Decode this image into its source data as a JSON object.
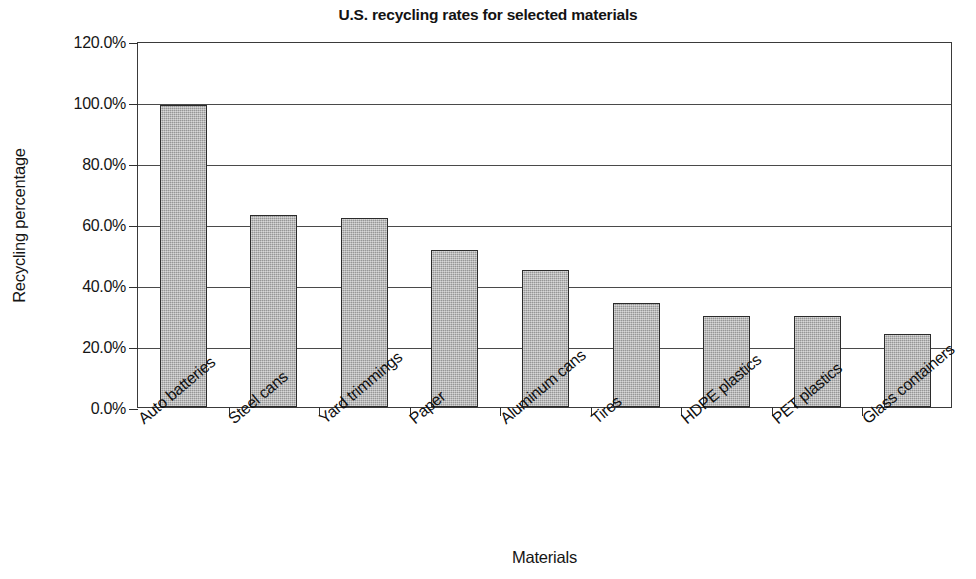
{
  "chart_data": {
    "type": "bar",
    "title": "U.S. recycling rates for selected materials",
    "xlabel": "Materials",
    "ylabel": "Recycling percentage",
    "categories": [
      "Auto batteries",
      "Steel cans",
      "Yard trimmings",
      "Paper",
      "Aluminum cans",
      "Tires",
      "HDPE plastics",
      "PET plastics",
      "Glass containers"
    ],
    "values": [
      99.0,
      63.0,
      62.0,
      51.5,
      45.0,
      34.0,
      30.0,
      29.8,
      24.0
    ],
    "value_labels": [
      "99.0%",
      "63.0%",
      "62.0%",
      "51.5%",
      "45.0%",
      "34.0%",
      "30.0%",
      "29.8%",
      "24.0%"
    ],
    "ylim": [
      0,
      120
    ],
    "ytick_values": [
      0,
      20,
      40,
      60,
      80,
      100,
      120
    ],
    "ytick_labels": [
      "0.0%",
      "20.0%",
      "40.0%",
      "60.0%",
      "80.0%",
      "100.0%",
      "120.0%"
    ],
    "grid": true,
    "legend": false,
    "legend_position": "none",
    "bar_color": "#a8a8a8",
    "bar_border_color": "#2b2b2b",
    "axis_color": "#3a3a3a",
    "background_color": "#ffffff"
  }
}
